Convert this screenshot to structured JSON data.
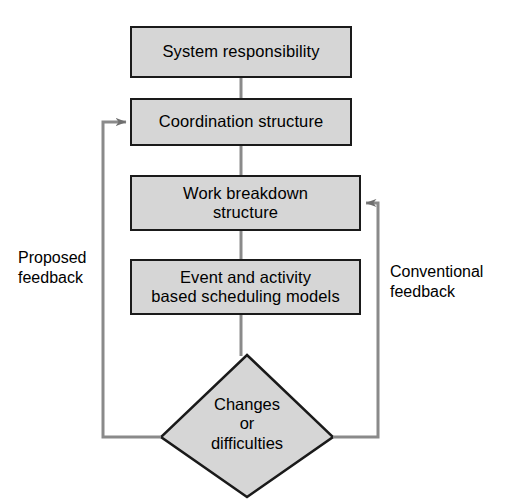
{
  "diagram": {
    "colors": {
      "node_fill": "#d6d6d6",
      "node_border": "#1a1a1a",
      "connector": "#8a8a8a",
      "text": "#000000",
      "background": "#ffffff"
    },
    "nodes": [
      {
        "id": "system-responsibility",
        "shape": "rectangle",
        "label": "System responsibility"
      },
      {
        "id": "coordination-structure",
        "shape": "rectangle",
        "label": "Coordination structure"
      },
      {
        "id": "work-breakdown-structure",
        "shape": "rectangle",
        "label": "Work breakdown\nstructure"
      },
      {
        "id": "scheduling-models",
        "shape": "rectangle",
        "label": "Event and activity\nbased scheduling models"
      },
      {
        "id": "changes-or-difficulties",
        "shape": "diamond",
        "label": "Changes\nor\ndifficulties"
      }
    ],
    "edge_labels": {
      "proposed_feedback": "Proposed\nfeedback",
      "conventional_feedback": "Conventional\nfeedback"
    },
    "connections": [
      {
        "from": "system-responsibility",
        "to": "coordination-structure",
        "type": "vertical",
        "arrow": false
      },
      {
        "from": "coordination-structure",
        "to": "work-breakdown-structure",
        "type": "vertical",
        "arrow": false
      },
      {
        "from": "work-breakdown-structure",
        "to": "scheduling-models",
        "type": "vertical",
        "arrow": false
      },
      {
        "from": "scheduling-models",
        "to": "changes-or-difficulties",
        "type": "vertical",
        "arrow": false
      },
      {
        "from": "changes-or-difficulties",
        "to": "coordination-structure",
        "type": "feedback-left",
        "label": "Proposed feedback",
        "arrow": true
      },
      {
        "from": "changes-or-difficulties",
        "to": "work-breakdown-structure",
        "type": "feedback-right",
        "label": "Conventional feedback",
        "arrow": true
      }
    ]
  }
}
